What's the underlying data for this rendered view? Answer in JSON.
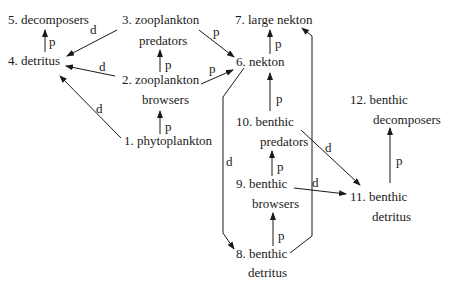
{
  "diagram": {
    "type": "food web",
    "nodes": [
      {
        "id": 1,
        "label": "1. phytoplankton",
        "lines": [
          "1. phytoplankton"
        ]
      },
      {
        "id": 2,
        "label": "2. zooplankton browsers",
        "lines": [
          "2. zooplankton",
          "browsers"
        ]
      },
      {
        "id": 3,
        "label": "3. zooplankton predators",
        "lines": [
          "3. zooplankton",
          "predators"
        ]
      },
      {
        "id": 4,
        "label": "4. detritus",
        "lines": [
          "4. detritus"
        ]
      },
      {
        "id": 5,
        "label": "5. decomposers",
        "lines": [
          "5. decomposers"
        ]
      },
      {
        "id": 6,
        "label": "6. nekton",
        "lines": [
          "6. nekton"
        ]
      },
      {
        "id": 7,
        "label": "7. large nekton",
        "lines": [
          "7. large nekton"
        ]
      },
      {
        "id": 8,
        "label": "8. benthic detritus",
        "lines": [
          "8. benthic",
          "detritus"
        ]
      },
      {
        "id": 9,
        "label": "9. benthic browsers",
        "lines": [
          "9. benthic",
          "browsers"
        ]
      },
      {
        "id": 10,
        "label": "10. benthic predators",
        "lines": [
          "10. benthic",
          "predators"
        ]
      },
      {
        "id": 11,
        "label": "11. benthic detritus",
        "lines": [
          "11. benthic",
          "detritus"
        ]
      },
      {
        "id": 12,
        "label": "12. benthic decomposers",
        "lines": [
          "12. benthic",
          "decomposers"
        ]
      }
    ],
    "edges": [
      {
        "from": 4,
        "to": 5,
        "label": "p"
      },
      {
        "from": 3,
        "to": 4,
        "label": "d"
      },
      {
        "from": 2,
        "to": 4,
        "label": "d"
      },
      {
        "from": 1,
        "to": 4,
        "label": "d"
      },
      {
        "from": 2,
        "to": 3,
        "label": "p"
      },
      {
        "from": 1,
        "to": 2,
        "label": "p"
      },
      {
        "from": 3,
        "to": 6,
        "label": "p"
      },
      {
        "from": 2,
        "to": 6,
        "label": "p"
      },
      {
        "from": 6,
        "to": 7,
        "label": "p"
      },
      {
        "from": 10,
        "to": 6,
        "label": "p"
      },
      {
        "from": 9,
        "to": 10,
        "label": "p"
      },
      {
        "from": 8,
        "to": 9,
        "label": "p"
      },
      {
        "from": 6,
        "to": 8,
        "label": "d"
      },
      {
        "from": 8,
        "to": 7,
        "label": "p"
      },
      {
        "from": 10,
        "to": 11,
        "label": "d"
      },
      {
        "from": 9,
        "to": 11,
        "label": "d"
      },
      {
        "from": 11,
        "to": 12,
        "label": "p"
      }
    ],
    "edge_label_legend": {
      "p": "p",
      "d": "d"
    }
  }
}
